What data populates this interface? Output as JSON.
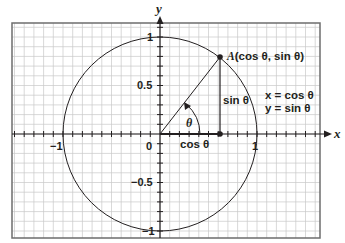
{
  "figure": {
    "axes": {
      "x_label": "x",
      "y_label": "y",
      "x_ticks": [
        {
          "value": -1,
          "label": "−1"
        },
        {
          "value": 0,
          "label": "0"
        },
        {
          "value": 1,
          "label": "1"
        }
      ],
      "y_ticks": [
        {
          "value": 1,
          "label": "1"
        },
        {
          "value": 0.5,
          "label": "0.5"
        },
        {
          "value": -0.5,
          "label": "−0.5"
        },
        {
          "value": -1,
          "label": "−1"
        }
      ],
      "minor_tick_step": 0.1,
      "grid_step": 0.1
    },
    "circle": {
      "radius": 1,
      "center": [
        0,
        0
      ]
    },
    "point_A": {
      "label_prefix": "A",
      "label_coords": "(cos θ, sin θ)",
      "x": 0.62,
      "y": 0.79
    },
    "angle_label": "θ",
    "segment_labels": {
      "horizontal": "cos θ",
      "vertical": "sin θ"
    },
    "equations": [
      "x = cos θ",
      "y = sin θ"
    ],
    "colors": {
      "ink": "#231f20",
      "grid": "#c8c8c8",
      "border": "#6d6d6d",
      "background": "#ffffff"
    }
  }
}
